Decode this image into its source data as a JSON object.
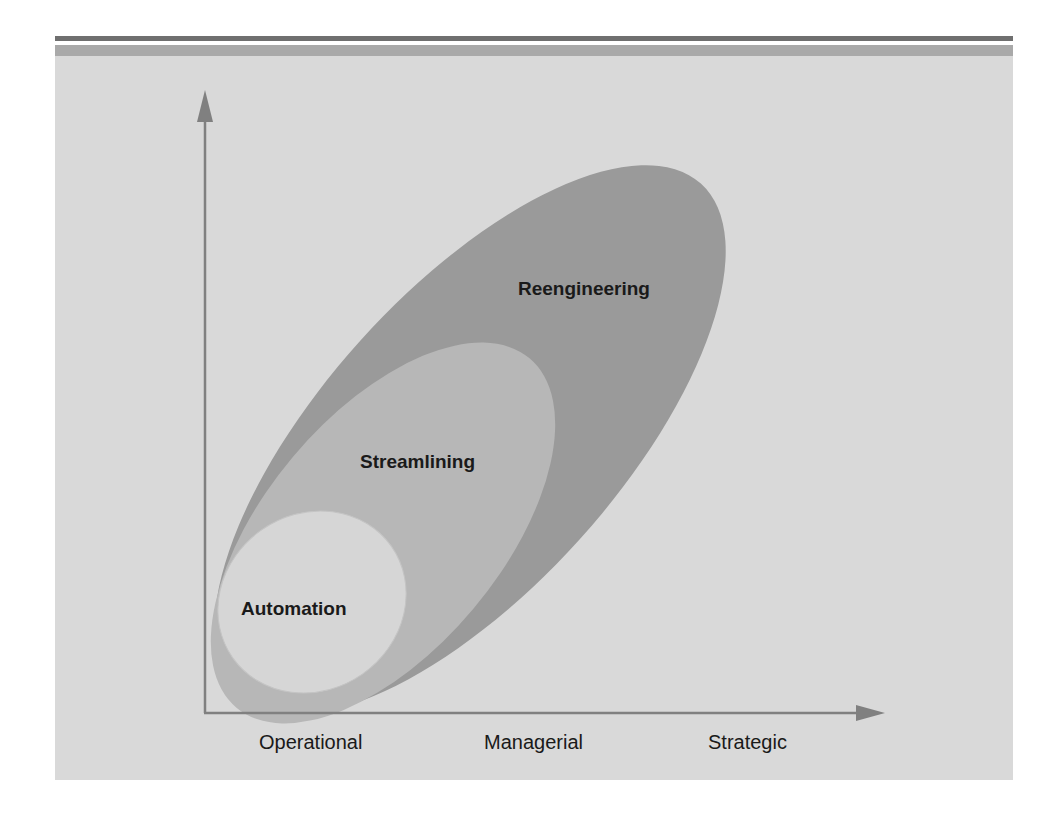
{
  "diagram": {
    "type": "nested-ellipses",
    "colors": {
      "background": "#d9d9d9",
      "header_band": "#a9a9a9",
      "top_rule": "#6f6f6f",
      "axis": "#808080",
      "reengineering_fill": "#9a9a9a",
      "streamlining_fill": "#b7b7b7",
      "automation_fill": "#d6d6d6"
    },
    "regions": [
      {
        "label": "Reengineering"
      },
      {
        "label": "Streamlining"
      },
      {
        "label": "Automation"
      }
    ],
    "x_axis": {
      "labels": [
        "Operational",
        "Managerial",
        "Strategic"
      ]
    }
  }
}
